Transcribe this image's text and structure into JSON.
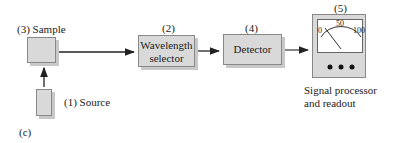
{
  "diagram": {
    "figure_label": "(c)",
    "components": [
      {
        "id": "source",
        "number": "(1)",
        "label": "Source"
      },
      {
        "id": "wavelength_selector",
        "number": "(2)",
        "label_line1": "Wavelength",
        "label_line2": "selector"
      },
      {
        "id": "sample",
        "number": "(3)",
        "label": "Sample"
      },
      {
        "id": "detector",
        "number": "(4)",
        "label": "Detector"
      },
      {
        "id": "readout",
        "number": "(5)",
        "label_line1": "Signal processor",
        "label_line2": "and readout"
      }
    ],
    "meter": {
      "scale_min": "0",
      "scale_mid": "50",
      "scale_max": "100"
    },
    "labels": {
      "sample": "(3) Sample",
      "source": "(1) Source",
      "selector_num": "(2)",
      "detector_num": "(4)",
      "readout_num": "(5)"
    },
    "colors": {
      "box_fill": "#d9d9d9",
      "line": "#222222"
    }
  }
}
